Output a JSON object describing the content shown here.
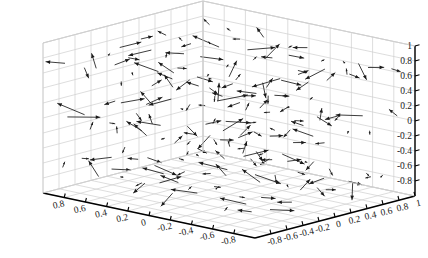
{
  "figure": {
    "type": "matlab-3d-quiver-plot",
    "width": 428,
    "height": 258,
    "background_color": "#ffffff",
    "axis_color": "#000000",
    "grid_color": "#cfcfcf",
    "arrow_color": "#1a1a1a",
    "title": "",
    "has_legend": false,
    "has_colorbar": false
  },
  "axes": {
    "z": {
      "label": "",
      "ticks": [
        "1",
        "0.8",
        "0.6",
        "0.4",
        "0.2",
        "0",
        "-0.2",
        "-0.4",
        "-0.6",
        "-0.8"
      ],
      "values": [
        1,
        0.8,
        0.6,
        0.4,
        0.2,
        0,
        -0.2,
        -0.4,
        -0.6,
        -0.8
      ],
      "range": [
        -1,
        1
      ]
    },
    "x": {
      "label": "",
      "ticks": [
        "0.8",
        "0.6",
        "0.4",
        "0.2",
        "0",
        "-0.2",
        "-0.4",
        "-0.6",
        "-0.8"
      ],
      "values": [
        0.8,
        0.6,
        0.4,
        0.2,
        0,
        -0.2,
        -0.4,
        -0.6,
        -0.8
      ],
      "range": [
        -1,
        1
      ]
    },
    "y": {
      "label": "",
      "ticks": [
        "-0.8",
        "-0.6",
        "-0.4",
        "-0.2",
        "0",
        "0.2",
        "0.4",
        "0.6",
        "0.8",
        "1"
      ],
      "values": [
        -0.8,
        -0.6,
        -0.4,
        -0.2,
        0,
        0.2,
        0.4,
        0.6,
        0.8,
        1
      ],
      "range": [
        -1,
        1
      ]
    }
  },
  "chart_data": {
    "type": "scatter",
    "subtype": "quiver3",
    "title": "",
    "xlabel": "",
    "ylabel": "",
    "zlabel": "",
    "xlim": [
      -1,
      1
    ],
    "ylim": [
      -1,
      1
    ],
    "zlim": [
      -1,
      1
    ],
    "grid": true,
    "legend": null,
    "legend_position": "none",
    "xticks": [
      0.8,
      0.6,
      0.4,
      0.2,
      0,
      -0.2,
      -0.4,
      -0.6,
      -0.8
    ],
    "yticks": [
      -0.8,
      -0.6,
      -0.4,
      -0.2,
      0,
      0.2,
      0.4,
      0.6,
      0.8,
      1
    ],
    "zticks": [
      1,
      0.8,
      0.6,
      0.4,
      0.2,
      0,
      -0.2,
      -0.4,
      -0.6,
      -0.8
    ],
    "arrow_color": "#1a1a1a",
    "layers": [
      {
        "z": 0.7,
        "count": 64
      },
      {
        "z": 0.0,
        "count": 64
      },
      {
        "z": -0.7,
        "count": 64
      }
    ],
    "vectors_seed": 7,
    "grid_n": 8,
    "vector_scale": 0.16
  },
  "projection": {
    "origin_front": [
      255,
      238
    ],
    "corner_left": [
      43,
      193
    ],
    "corner_right": [
      415,
      196
    ],
    "corner_back": [
      255,
      14
    ],
    "z_axis_top": [
      43,
      43
    ],
    "z_axis_bottom": [
      43,
      193
    ],
    "z_height_px": 150
  }
}
